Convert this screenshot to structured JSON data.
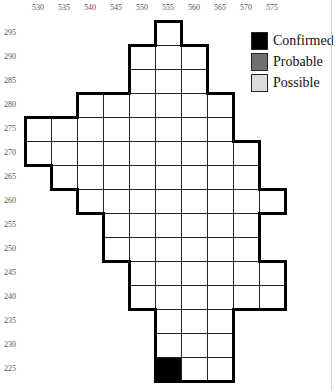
{
  "chart_data": {
    "type": "heatmap",
    "title": "",
    "xlabel": "",
    "ylabel": "",
    "x_ticks": [
      530,
      535,
      540,
      545,
      550,
      555,
      560,
      565,
      570,
      575
    ],
    "y_ticks": [
      295,
      290,
      285,
      280,
      275,
      270,
      265,
      260,
      255,
      250,
      245,
      240,
      235,
      230,
      225
    ],
    "legend": [
      {
        "label": "Confirmed",
        "color": "#000000"
      },
      {
        "label": "Probable",
        "color": "#707070"
      },
      {
        "label": "Possible",
        "color": "#dcdcdc"
      }
    ],
    "rows": [
      {
        "y": 295,
        "x_from": 555,
        "x_to": 555
      },
      {
        "y": 290,
        "x_from": 550,
        "x_to": 560
      },
      {
        "y": 285,
        "x_from": 550,
        "x_to": 560
      },
      {
        "y": 280,
        "x_from": 540,
        "x_to": 565
      },
      {
        "y": 275,
        "x_from": 530,
        "x_to": 565
      },
      {
        "y": 270,
        "x_from": 530,
        "x_to": 570
      },
      {
        "y": 265,
        "x_from": 535,
        "x_to": 570
      },
      {
        "y": 260,
        "x_from": 540,
        "x_to": 575
      },
      {
        "y": 255,
        "x_from": 545,
        "x_to": 570
      },
      {
        "y": 250,
        "x_from": 545,
        "x_to": 570
      },
      {
        "y": 245,
        "x_from": 550,
        "x_to": 575
      },
      {
        "y": 240,
        "x_from": 550,
        "x_to": 575
      },
      {
        "y": 235,
        "x_from": 555,
        "x_to": 565
      },
      {
        "y": 230,
        "x_from": 555,
        "x_to": 565
      },
      {
        "y": 225,
        "x_from": 555,
        "x_to": 565
      }
    ],
    "status_cells": [
      {
        "x": 555,
        "y": 225,
        "status": "Confirmed"
      }
    ],
    "grid": true,
    "legend_position": "top-right"
  },
  "layout": {
    "x0": 25,
    "y0": 21,
    "cell_w": 26,
    "cell_h": 24,
    "x_start": 530,
    "y_start": 295,
    "step": 5
  }
}
